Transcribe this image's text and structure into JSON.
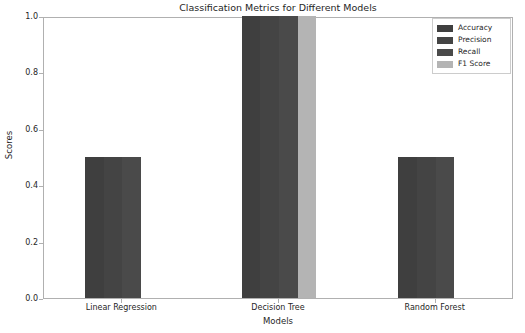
{
  "chart_data": {
    "type": "bar",
    "title": "Classification Metrics for Different Models",
    "xlabel": "Models",
    "ylabel": "Scores",
    "categories": [
      "Linear Regression",
      "Decision Tree",
      "Random Forest"
    ],
    "series": [
      {
        "name": "Accuracy",
        "values": [
          0.5,
          1.0,
          0.5
        ],
        "color": "#3f3f3f"
      },
      {
        "name": "Precision",
        "values": [
          0.5,
          1.0,
          0.5
        ],
        "color": "#444444"
      },
      {
        "name": "Recall",
        "values": [
          0.5,
          1.0,
          0.5
        ],
        "color": "#4a4a4a"
      },
      {
        "name": "F1 Score",
        "values": [
          0.0,
          1.0,
          0.0
        ],
        "color": "#b4b4b4"
      }
    ],
    "ylim": [
      0.0,
      1.0
    ],
    "yticks": [
      "0.0",
      "0.2",
      "0.4",
      "0.6",
      "0.8",
      "1.0"
    ],
    "ytick_values": [
      0.0,
      0.2,
      0.4,
      0.6,
      0.8,
      1.0
    ],
    "grid": false,
    "legend_position": "upper right"
  },
  "legend": {
    "entries": [
      {
        "label": "Accuracy",
        "color": "#3f3f3f"
      },
      {
        "label": "Precision",
        "color": "#444444"
      },
      {
        "label": "Recall",
        "color": "#4a4a4a"
      },
      {
        "label": "F1 Score",
        "color": "#b4b4b4"
      }
    ]
  }
}
